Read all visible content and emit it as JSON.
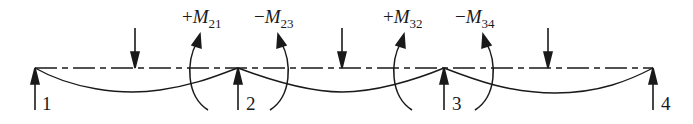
{
  "diagram": {
    "type": "continuous-beam-deflection",
    "colors": {
      "line": "#1a1a1a",
      "background": "#ffffff"
    },
    "beam": {
      "y": 68,
      "x_start": 35,
      "x_end": 653,
      "style": "dash-dot-centerline"
    },
    "supports": [
      {
        "id": "1",
        "label": "1",
        "x": 35
      },
      {
        "id": "2",
        "label": "2",
        "x": 238
      },
      {
        "id": "3",
        "label": "3",
        "x": 444
      },
      {
        "id": "4",
        "label": "4",
        "x": 653
      }
    ],
    "loads": [
      {
        "span": "1-2",
        "x": 135,
        "direction": "down"
      },
      {
        "span": "2-3",
        "x": 342,
        "direction": "down"
      },
      {
        "span": "3-4",
        "x": 548,
        "direction": "down"
      }
    ],
    "moments": [
      {
        "label_sign": "+",
        "label_symbol": "M",
        "label_sub": "21",
        "joint": "2",
        "side": "left",
        "x": 192
      },
      {
        "label_sign": "−",
        "label_symbol": "M",
        "label_sub": "23",
        "joint": "2",
        "side": "right",
        "x": 288
      },
      {
        "label_sign": "+",
        "label_symbol": "M",
        "label_sub": "32",
        "joint": "3",
        "side": "left",
        "x": 398
      },
      {
        "label_sign": "−",
        "label_symbol": "M",
        "label_sub": "34",
        "joint": "3",
        "side": "right",
        "x": 490
      }
    ]
  }
}
